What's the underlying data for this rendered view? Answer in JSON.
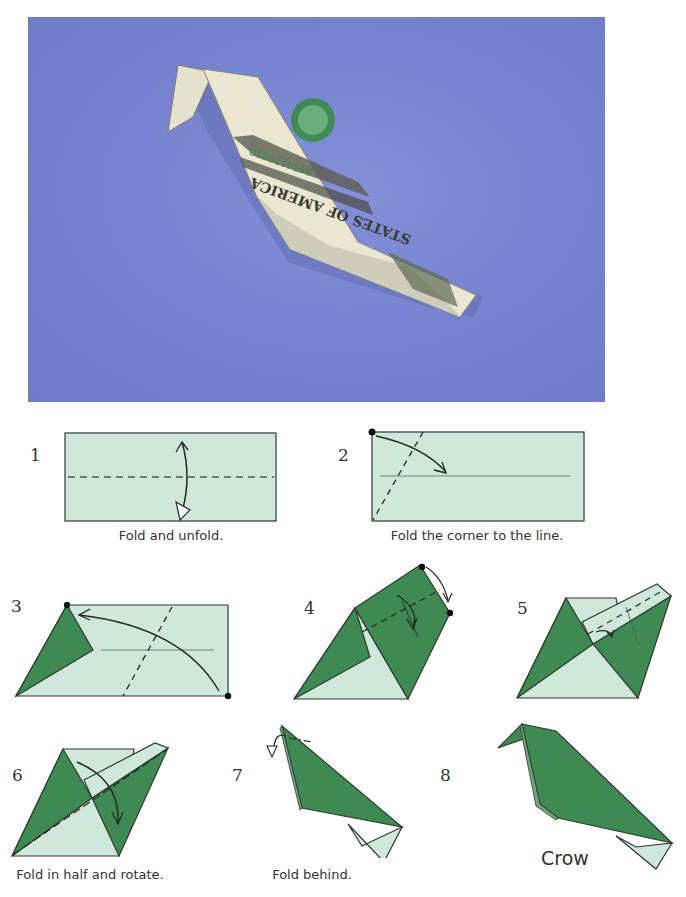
{
  "photo": {
    "description": "Dollar bill folded into an origami crow on a blue background",
    "serial_text": "A45411991B",
    "bill_text": "STATES OF AMERICA",
    "background_color": "#7884cc"
  },
  "colors": {
    "paper_light": "#cfe8d9",
    "paper_dark": "#3f8a52",
    "outline": "#2c3b30"
  },
  "steps": [
    {
      "number": "1",
      "caption": "Fold and unfold."
    },
    {
      "number": "2",
      "caption": "Fold the corner to the line."
    },
    {
      "number": "3",
      "caption": ""
    },
    {
      "number": "4",
      "caption": ""
    },
    {
      "number": "5",
      "caption": ""
    },
    {
      "number": "6",
      "caption": "Fold in half and rotate."
    },
    {
      "number": "7",
      "caption": "Fold behind."
    },
    {
      "number": "8",
      "caption": ""
    }
  ],
  "final_label": "Crow"
}
